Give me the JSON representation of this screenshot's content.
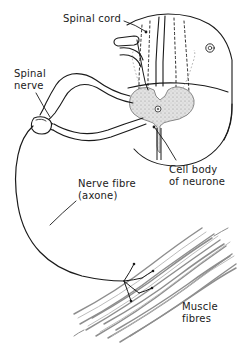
{
  "figure": {
    "background_color": "#ffffff",
    "ink_color": "#1a1a1a",
    "grey_matter_color": "#d9d9d9",
    "muscle_color": "#9a9a9a",
    "labels": {
      "spinal_cord": "Spinal cord",
      "spinal_nerve": "Spinal\nnerve",
      "cell_body": "Cell body\nof neurone",
      "nerve_fibre": "Nerve fibre\n(axone)",
      "muscle_fibres": "Muscle\nfibres"
    },
    "structures": [
      "spinal-cord-block",
      "grey-matter-butterfly",
      "central-canal",
      "dorsal-root",
      "ventral-root",
      "spinal-nerve-trunk",
      "axon",
      "motor-end-plates",
      "muscle-fibre-bundle"
    ]
  }
}
